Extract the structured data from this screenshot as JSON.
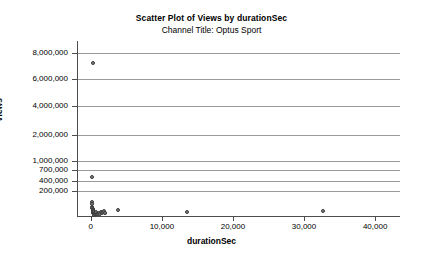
{
  "chart_data": {
    "type": "scatter",
    "title": "Scatter Plot of Views by durationSec",
    "subtitle": "Channel Title: Optus Sport",
    "xlabel": "durationSec",
    "ylabel": "Views",
    "grid": true,
    "legend": null,
    "xlim": [
      -1800,
      43500
    ],
    "xticks": [
      0,
      10000,
      20000,
      30000,
      40000
    ],
    "xtick_labels": [
      "0",
      "10,000",
      "20,000",
      "30,000",
      "40,000"
    ],
    "yticks": [
      200000,
      400000,
      700000,
      1000000,
      2000000,
      4000000,
      6000000,
      8000000
    ],
    "ytick_labels": [
      "200,000",
      "400,000",
      "700,000",
      "1,000,000",
      "2,000,000",
      "4,000,000",
      "6,000,000",
      "8,000,000"
    ],
    "y_axis_note": "broken/compressed axis: 200,000-1,000,000 ticks are spaced closely below the linear 2,000,000-8,000,000 region",
    "marker_color": "#808080",
    "marker_edge_color": "#3c3c3c",
    "gridline_color": "#9a9a9a",
    "axis_color": "#4d4d4d",
    "points": [
      {
        "x": 300,
        "y": 7200000
      },
      {
        "x": 200,
        "y": 500000
      },
      {
        "x": 120,
        "y": 110000
      },
      {
        "x": 150,
        "y": 95000
      },
      {
        "x": 180,
        "y": 70000
      },
      {
        "x": 210,
        "y": 60000
      },
      {
        "x": 240,
        "y": 52000
      },
      {
        "x": 260,
        "y": 44000
      },
      {
        "x": 300,
        "y": 38000
      },
      {
        "x": 330,
        "y": 30000
      },
      {
        "x": 360,
        "y": 24000
      },
      {
        "x": 400,
        "y": 18000
      },
      {
        "x": 430,
        "y": 12000
      },
      {
        "x": 470,
        "y": 8000
      },
      {
        "x": 520,
        "y": 30000
      },
      {
        "x": 560,
        "y": 20000
      },
      {
        "x": 620,
        "y": 14000
      },
      {
        "x": 700,
        "y": 9000
      },
      {
        "x": 780,
        "y": 26000
      },
      {
        "x": 860,
        "y": 16000
      },
      {
        "x": 950,
        "y": 10000
      },
      {
        "x": 1100,
        "y": 22000
      },
      {
        "x": 1250,
        "y": 14000
      },
      {
        "x": 1400,
        "y": 30000
      },
      {
        "x": 1550,
        "y": 20000
      },
      {
        "x": 1700,
        "y": 26000
      },
      {
        "x": 1850,
        "y": 34000
      },
      {
        "x": 1950,
        "y": 18000
      },
      {
        "x": 2050,
        "y": 24000
      },
      {
        "x": 3800,
        "y": 42000
      },
      {
        "x": 13600,
        "y": 30000
      },
      {
        "x": 32600,
        "y": 36000
      }
    ]
  }
}
